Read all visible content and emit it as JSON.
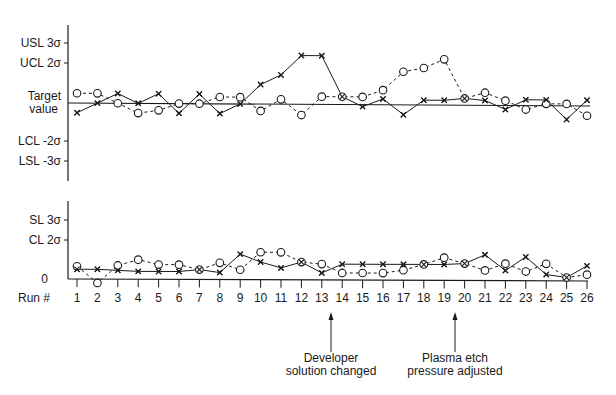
{
  "chart_data": [
    {
      "type": "line",
      "title": "",
      "panel": "top",
      "xlabel": "Run #",
      "ylabel": "",
      "ytick_labels": [
        "USL 3σ",
        "UCL 2σ",
        "Target value",
        "LCL -2σ",
        "LSL -3σ"
      ],
      "ytick_values": [
        3,
        2,
        0,
        -2,
        -3
      ],
      "ylim": [
        -4.0,
        4.0
      ],
      "reference_line": {
        "label": "Target value",
        "value": 0
      },
      "categories": [
        1,
        2,
        3,
        4,
        5,
        6,
        7,
        8,
        9,
        10,
        11,
        12,
        13,
        14,
        15,
        16,
        17,
        18,
        19,
        20,
        21,
        22,
        23,
        24,
        25,
        26
      ],
      "series": [
        {
          "name": "x (solid)",
          "marker": "x",
          "linestyle": "solid",
          "values": [
            -0.5,
            0.0,
            0.5,
            0.0,
            0.5,
            -0.5,
            0.5,
            -0.5,
            0.0,
            1.0,
            1.5,
            2.5,
            2.5,
            0.4,
            -0.1,
            0.3,
            -0.5,
            0.25,
            0.25,
            0.35,
            0.25,
            -0.2,
            0.3,
            0.3,
            -0.7,
            0.3
          ]
        },
        {
          "name": "o (dashed)",
          "marker": "o",
          "linestyle": "dashed",
          "values": [
            0.5,
            0.5,
            0.0,
            -0.5,
            -0.35,
            0.0,
            0.0,
            0.35,
            0.35,
            -0.35,
            0.25,
            -0.55,
            0.4,
            0.4,
            0.4,
            0.75,
            1.7,
            1.9,
            2.35,
            0.35,
            0.65,
            0.25,
            -0.2,
            0.1,
            0.1,
            -0.5
          ]
        }
      ]
    },
    {
      "type": "line",
      "title": "",
      "panel": "bottom",
      "xlabel": "Run #",
      "ylabel": "",
      "ytick_labels": [
        "SL 3σ",
        "CL 2σ",
        "0"
      ],
      "ytick_values": [
        3,
        2,
        0
      ],
      "ylim": [
        0,
        4.0
      ],
      "categories": [
        1,
        2,
        3,
        4,
        5,
        6,
        7,
        8,
        9,
        10,
        11,
        12,
        13,
        14,
        15,
        16,
        17,
        18,
        19,
        20,
        21,
        22,
        23,
        24,
        25,
        26
      ],
      "series": [
        {
          "name": "x (solid)",
          "marker": "x",
          "linestyle": "solid",
          "values": [
            0.5,
            0.5,
            0.45,
            0.4,
            0.4,
            0.4,
            0.5,
            0.35,
            1.3,
            0.9,
            0.6,
            0.9,
            0.35,
            0.8,
            0.8,
            0.8,
            0.8,
            0.8,
            0.8,
            0.85,
            1.3,
            0.5,
            1.2,
            0.3,
            0.15,
            0.75
          ]
        },
        {
          "name": "o (dashed)",
          "marker": "o",
          "linestyle": "dashed",
          "values": [
            0.65,
            -0.2,
            0.7,
            1.0,
            0.75,
            0.75,
            0.5,
            0.85,
            0.5,
            1.4,
            1.4,
            0.9,
            0.8,
            0.35,
            0.35,
            0.35,
            0.5,
            0.8,
            1.15,
            0.85,
            0.5,
            0.85,
            0.45,
            0.85,
            0.15,
            0.3
          ]
        }
      ]
    }
  ],
  "axis": {
    "run_label": "Run #",
    "runs": [
      "1",
      "2",
      "3",
      "4",
      "5",
      "6",
      "7",
      "8",
      "9",
      "10",
      "11",
      "12",
      "13",
      "14",
      "15",
      "16",
      "17",
      "18",
      "19",
      "20",
      "21",
      "22",
      "23",
      "24",
      "25",
      "26"
    ]
  },
  "top_labels": {
    "usl": "USL 3σ",
    "ucl": "UCL 2σ",
    "target_line1": "Target",
    "target_line2": "value",
    "lcl": "LCL -2σ",
    "lsl": "LSL -3σ"
  },
  "bottom_labels": {
    "sl": "SL 3σ",
    "cl": "CL 2σ",
    "zero": "0"
  },
  "annotations": [
    {
      "run": 13.5,
      "line1": "Developer",
      "line2": "solution changed"
    },
    {
      "run": 19.5,
      "line1": "Plasma etch",
      "line2": "pressure adjusted"
    }
  ],
  "colors": {
    "ink": "#1a1a1a",
    "background": "#ffffff"
  }
}
